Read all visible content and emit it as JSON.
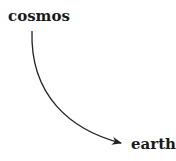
{
  "diagram": {
    "nodes": [
      {
        "id": "cosmos",
        "label": "cosmos"
      },
      {
        "id": "earth",
        "label": "earth"
      }
    ],
    "edges": [
      {
        "from": "cosmos",
        "to": "earth",
        "style": "curved-arrow"
      }
    ],
    "colors": {
      "text": "#1a1a1a",
      "edge": "#222222",
      "background": "#ffffff"
    }
  }
}
